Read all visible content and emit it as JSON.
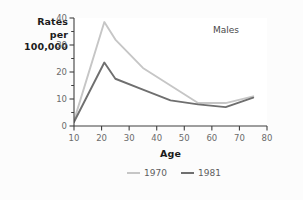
{
  "chart_data": {
    "type": "line",
    "title": "",
    "annotation": "Males",
    "xlabel": "Age",
    "ylabel": "Rates per 100,000",
    "ylabel_lines": [
      "Rates",
      "per",
      "100,000"
    ],
    "xlim": [
      10,
      80
    ],
    "ylim": [
      0,
      40
    ],
    "xticks": [
      10,
      20,
      30,
      40,
      50,
      60,
      70,
      80
    ],
    "yticks": [
      0,
      10,
      20,
      30,
      40
    ],
    "xtick_labels": [
      "10",
      "20",
      "30",
      "40",
      "50",
      "60",
      "70",
      "80"
    ],
    "ytick_labels": [
      "0",
      "10",
      "20",
      "30",
      "40"
    ],
    "minor_yticks": [
      5,
      15,
      25,
      35
    ],
    "grid": false,
    "legend_position": "below",
    "series": [
      {
        "name": "1970",
        "color": "#c6c6c6",
        "x": [
          10,
          21,
          25,
          35,
          45,
          55,
          65,
          75
        ],
        "values": [
          2.0,
          38.5,
          32.0,
          21.5,
          15.0,
          8.5,
          8.5,
          11.0
        ]
      },
      {
        "name": "1981",
        "color": "#6f6f6f",
        "x": [
          10,
          21,
          25,
          35,
          45,
          55,
          65,
          75
        ],
        "values": [
          1.5,
          23.5,
          17.5,
          13.5,
          9.5,
          8.0,
          7.0,
          10.5
        ]
      }
    ]
  },
  "legend": {
    "entries": [
      {
        "label": "1970",
        "color": "#c6c6c6"
      },
      {
        "label": "1981",
        "color": "#6f6f6f"
      }
    ]
  },
  "colors": {
    "background": "#fcfcfc",
    "plot_background": "#ffffff",
    "axis": "#3f3f3f",
    "tick_text": "#6b6b6b",
    "label_text": "#1b1b1b",
    "series_1970": "#c6c6c6",
    "series_1981": "#6f6f6f"
  }
}
